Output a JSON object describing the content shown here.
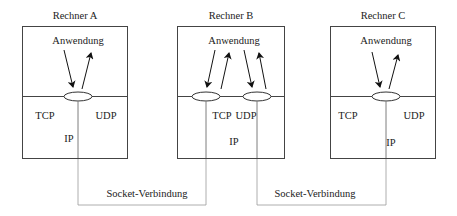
{
  "computers": [
    {
      "title": "Rechner A",
      "application": "Anwendung",
      "tcp": "TCP",
      "udp": "UDP",
      "ip": "IP"
    },
    {
      "title": "Rechner B",
      "application": "Anwendung",
      "tcp": "TCP",
      "udp": "UDP",
      "ip": "IP"
    },
    {
      "title": "Rechner C",
      "application": "Anwendung",
      "tcp": "TCP",
      "udp": "UDP",
      "ip": "IP"
    }
  ],
  "connections": [
    {
      "label": "Socket-Verbindung",
      "from": "Rechner A",
      "to": "Rechner B"
    },
    {
      "label": "Socket-Verbindung",
      "from": "Rechner B",
      "to": "Rechner C"
    }
  ]
}
